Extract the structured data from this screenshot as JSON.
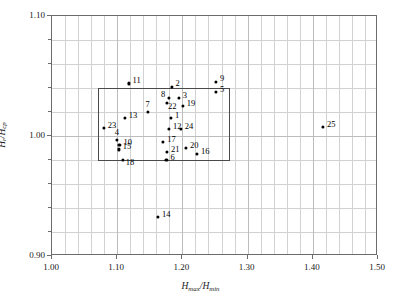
{
  "chart_data": {
    "type": "scatter",
    "title": "",
    "xlabel": "Hmax/Hmin",
    "ylabel": "Hr/Hcp",
    "xlim": [
      1.0,
      1.5
    ],
    "ylim": [
      0.9,
      1.1
    ],
    "xticks": [
      "1.00",
      "1.10",
      "1.20",
      "1.30",
      "1.40",
      "1.50"
    ],
    "xtick_values": [
      1.0,
      1.1,
      1.2,
      1.3,
      1.4,
      1.5
    ],
    "yticks": [
      "0.90",
      "1.00",
      "1.10"
    ],
    "ytick_values": [
      0.9,
      1.0,
      1.1
    ],
    "x_minor_step": 0.02,
    "y_minor_step": 0.02,
    "grid": true,
    "legend": null,
    "points": [
      {
        "label": "11",
        "x": 1.119,
        "y": 1.043
      },
      {
        "label": "2",
        "x": 1.185,
        "y": 1.04
      },
      {
        "label": "9",
        "x": 1.253,
        "y": 1.044
      },
      {
        "label": "5",
        "x": 1.253,
        "y": 1.036
      },
      {
        "label": "8",
        "x": 1.181,
        "y": 1.031
      },
      {
        "label": "3",
        "x": 1.196,
        "y": 1.031
      },
      {
        "label": "22",
        "x": 1.178,
        "y": 1.027
      },
      {
        "label": "19",
        "x": 1.202,
        "y": 1.024
      },
      {
        "label": "7",
        "x": 1.148,
        "y": 1.019
      },
      {
        "label": "13",
        "x": 1.113,
        "y": 1.014
      },
      {
        "label": "1",
        "x": 1.184,
        "y": 1.014
      },
      {
        "label": "23",
        "x": 1.081,
        "y": 1.006
      },
      {
        "label": "12",
        "x": 1.181,
        "y": 1.005
      },
      {
        "label": "24",
        "x": 1.199,
        "y": 1.005
      },
      {
        "label": "25",
        "x": 1.417,
        "y": 1.007
      },
      {
        "label": "4",
        "x": 1.101,
        "y": 0.996
      },
      {
        "label": "17",
        "x": 1.172,
        "y": 0.994
      },
      {
        "label": "10",
        "x": 1.105,
        "y": 0.992
      },
      {
        "label": "15",
        "x": 1.104,
        "y": 0.988
      },
      {
        "label": "20",
        "x": 1.207,
        "y": 0.989
      },
      {
        "label": "21",
        "x": 1.178,
        "y": 0.986
      },
      {
        "label": "16",
        "x": 1.224,
        "y": 0.984
      },
      {
        "label": "18",
        "x": 1.11,
        "y": 0.979
      },
      {
        "label": "6",
        "x": 1.177,
        "y": 0.979
      },
      {
        "label": "14",
        "x": 1.164,
        "y": 0.932
      }
    ],
    "label_offsets": {
      "11": {
        "dx": 4,
        "dy": -4
      },
      "2": {
        "dx": 4,
        "dy": -5
      },
      "9": {
        "dx": 4,
        "dy": -5
      },
      "5": {
        "dx": 4,
        "dy": -4
      },
      "8": {
        "dx": -8,
        "dy": -5
      },
      "3": {
        "dx": 4,
        "dy": -4
      },
      "22": {
        "dx": 1,
        "dy": 2
      },
      "19": {
        "dx": 4,
        "dy": -4
      },
      "7": {
        "dx": -2,
        "dy": -9
      },
      "13": {
        "dx": 4,
        "dy": -4
      },
      "1": {
        "dx": 4,
        "dy": -4
      },
      "23": {
        "dx": 4,
        "dy": -4
      },
      "12": {
        "dx": 4,
        "dy": -4
      },
      "24": {
        "dx": 4,
        "dy": -4
      },
      "25": {
        "dx": 4,
        "dy": -4
      },
      "4": {
        "dx": -2,
        "dy": -9
      },
      "17": {
        "dx": 4,
        "dy": -4
      },
      "10": {
        "dx": 4,
        "dy": -4
      },
      "15": {
        "dx": 4,
        "dy": -4
      },
      "20": {
        "dx": 4,
        "dy": -4
      },
      "21": {
        "dx": 4,
        "dy": -4
      },
      "16": {
        "dx": 4,
        "dy": -4
      },
      "18": {
        "dx": 3,
        "dy": 1
      },
      "6": {
        "dx": 4,
        "dy": -4
      },
      "14": {
        "dx": 4,
        "dy": -4
      }
    },
    "highlight_box": {
      "x0": 1.071,
      "x1": 1.273,
      "y0": 0.979,
      "y1": 1.04,
      "description": "rectangular selection region"
    }
  },
  "axes": {
    "xlabel_parts": {
      "main1": "H",
      "sub1": "max",
      "slash": "/",
      "main2": "H",
      "sub2": "min"
    },
    "ylabel_parts": {
      "main1": "H",
      "sub1": "r",
      "slash": "/",
      "main2": "H",
      "sub2": "cp"
    }
  }
}
